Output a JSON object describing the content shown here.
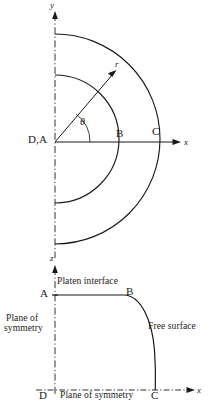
{
  "figure": {
    "background_color": "#ffffff",
    "stroke_color": "#1a1a1a",
    "panels": [
      {
        "id": "top-panel",
        "description": "Quarter annulus in polar coordinates with radius r and angle theta",
        "axes": {
          "x_label": "x",
          "y_label": "y"
        },
        "points": [
          {
            "id": "DA",
            "label": "D,A"
          },
          {
            "id": "B",
            "label": "B"
          },
          {
            "id": "C",
            "label": "C"
          }
        ],
        "annotations": [
          {
            "id": "radius",
            "label": "r"
          },
          {
            "id": "angle",
            "label": "θ"
          }
        ]
      },
      {
        "id": "bottom-panel",
        "description": "Axisymmetric section: platen interface AB, free surface BC, planes of symmetry AD and DC",
        "axes": {
          "x_label": "x",
          "z_label": "z"
        },
        "points": [
          {
            "id": "A",
            "label": "A"
          },
          {
            "id": "B",
            "label": "B"
          },
          {
            "id": "C",
            "label": "C"
          },
          {
            "id": "D",
            "label": "D"
          }
        ],
        "annotations": [
          {
            "id": "platen-interface",
            "label": "Platen interface"
          },
          {
            "id": "plane-of-symmetry-left-line1",
            "label": "Plane of"
          },
          {
            "id": "plane-of-symmetry-left-line2",
            "label": "symmetry"
          },
          {
            "id": "free-surface",
            "label": "Free surface"
          },
          {
            "id": "plane-of-symmetry-bottom",
            "label": "Plane of symmetry"
          }
        ]
      }
    ]
  }
}
